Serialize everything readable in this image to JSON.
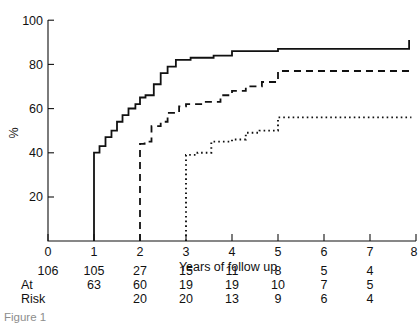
{
  "chart_data": {
    "type": "line",
    "title": "",
    "xlabel": "Years of follow up",
    "ylabel": "%",
    "xlim": [
      0,
      8
    ],
    "ylim": [
      0,
      100
    ],
    "xticks": [
      0,
      1,
      2,
      3,
      4,
      5,
      6,
      7,
      8
    ],
    "yticks": [
      0,
      20,
      40,
      60,
      80,
      100
    ],
    "grid": false,
    "legend": "none",
    "series": [
      {
        "name": "solid",
        "style": "solid",
        "x": [
          1,
          1,
          1.12,
          1.25,
          1.38,
          1.5,
          1.62,
          1.75,
          1.9,
          2.0,
          2.12,
          2.3,
          2.45,
          2.6,
          2.78,
          3.1,
          3.6,
          4.0,
          5.0,
          7.85
        ],
        "y": [
          0,
          40,
          43,
          47,
          50,
          54,
          57,
          60,
          62,
          65,
          66,
          71,
          76,
          79,
          82,
          83,
          84,
          86,
          87,
          91
        ]
      },
      {
        "name": "dashed",
        "style": "dashed",
        "x": [
          2,
          2,
          2.1,
          2.25,
          2.45,
          2.6,
          2.85,
          3.0,
          3.4,
          3.75,
          4.0,
          4.3,
          4.65,
          5.0,
          7.9
        ],
        "y": [
          0,
          44,
          45,
          52,
          54,
          58,
          61,
          62,
          63,
          66,
          68,
          70,
          72,
          77,
          77
        ]
      },
      {
        "name": "dotted",
        "style": "dotted",
        "x": [
          3,
          3,
          3.25,
          3.55,
          4.0,
          4.3,
          4.6,
          5.0,
          7.9
        ],
        "y": [
          0,
          39,
          40,
          45,
          46,
          49,
          50,
          56,
          56
        ]
      }
    ],
    "table": {
      "row_label": [
        "At",
        "Risk"
      ],
      "columns": [
        0,
        1,
        2,
        3,
        4,
        5,
        6,
        7
      ],
      "rows": [
        [
          "106",
          "105",
          "27",
          "15",
          "11",
          "8",
          "5",
          "4"
        ],
        [
          "",
          "63",
          "60",
          "19",
          "19",
          "10",
          "7",
          "5"
        ],
        [
          "",
          "",
          "20",
          "20",
          "13",
          "9",
          "6",
          "4"
        ]
      ]
    }
  },
  "caption": "Figure 1"
}
